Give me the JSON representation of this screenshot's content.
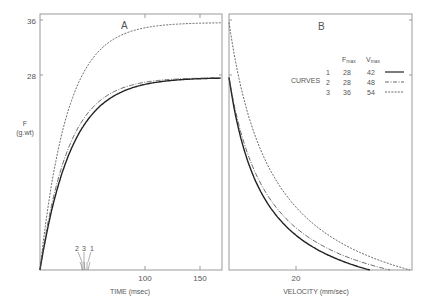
{
  "chart_data": [
    {
      "panel": "A",
      "type": "line",
      "title": "A",
      "xlabel": "TIME (msec)",
      "ylabel": "F",
      "ylabel_unit": "(g.wt)",
      "x_ticks": [
        100,
        150
      ],
      "y_ticks": [
        28,
        36
      ],
      "xlim": [
        0,
        165
      ],
      "ylim": [
        0,
        37
      ],
      "markers": {
        "labels": [
          "2",
          "3",
          "1"
        ],
        "description": "half-rise time markers for curves 2, 3, 1"
      },
      "series": [
        {
          "name": "1",
          "style": "solid",
          "Fmax": 28,
          "Vmax": 42,
          "x": [
            0,
            20,
            40,
            60,
            80,
            100,
            120,
            140,
            165
          ],
          "y": [
            0,
            12.5,
            19.5,
            23.5,
            25.7,
            26.9,
            27.5,
            27.8,
            28
          ]
        },
        {
          "name": "2",
          "style": "dash-dot",
          "Fmax": 28,
          "Vmax": 48,
          "x": [
            0,
            20,
            40,
            60,
            80,
            100,
            120,
            140,
            165
          ],
          "y": [
            0,
            13.6,
            20.6,
            24.3,
            26.2,
            27.2,
            27.6,
            27.9,
            28
          ]
        },
        {
          "name": "3",
          "style": "dashed",
          "Fmax": 36,
          "Vmax": 54,
          "x": [
            0,
            20,
            40,
            60,
            80,
            100,
            120,
            140,
            165
          ],
          "y": [
            0,
            19,
            27,
            31,
            33.3,
            34.5,
            35.2,
            35.6,
            35.9
          ]
        }
      ]
    },
    {
      "panel": "B",
      "type": "line",
      "title": "B",
      "xlabel": "VELOCITY (mm/sec)",
      "ylabel": "F",
      "x_ticks": [
        20
      ],
      "xlim": [
        0,
        54
      ],
      "ylim": [
        0,
        37
      ],
      "series": [
        {
          "name": "1",
          "style": "solid",
          "Fmax": 28,
          "Vmax": 42,
          "x": [
            0,
            5,
            10,
            20,
            30,
            42
          ],
          "y": [
            28,
            17.8,
            11.9,
            5.4,
            2.1,
            0
          ]
        },
        {
          "name": "2",
          "style": "dash-dot",
          "Fmax": 28,
          "Vmax": 48,
          "x": [
            0,
            5,
            10,
            20,
            30,
            40,
            48
          ],
          "y": [
            28,
            18.5,
            12.9,
            6.3,
            3.0,
            0.9,
            0
          ]
        },
        {
          "name": "3",
          "style": "dashed",
          "Fmax": 36,
          "Vmax": 54,
          "x": [
            0,
            5,
            10,
            20,
            30,
            40,
            54
          ],
          "y": [
            36,
            24.5,
            17.5,
            9.3,
            4.8,
            2.0,
            0
          ]
        }
      ]
    }
  ],
  "panels": {
    "a": {
      "label": "A",
      "y_tick_36": "36",
      "y_tick_28": "28",
      "y_label": "F",
      "y_unit": "(g.wt)",
      "x_tick_100": "100",
      "x_tick_150": "150",
      "x_label": "TIME (msec)",
      "marker_2": "2",
      "marker_3": "3",
      "marker_1": "1"
    },
    "b": {
      "label": "B",
      "x_tick_20": "20",
      "x_label": "VELOCITY (mm/sec)"
    }
  },
  "legend": {
    "title": "CURVES",
    "col_fmax": "F",
    "col_fmax_sub": "max",
    "col_vmax": "V",
    "col_vmax_sub": "max",
    "rows": [
      {
        "id": "1",
        "fmax": "28",
        "vmax": "42",
        "style": "solid"
      },
      {
        "id": "2",
        "fmax": "28",
        "vmax": "48",
        "style": "dash-dot"
      },
      {
        "id": "3",
        "fmax": "36",
        "vmax": "54",
        "style": "dashed"
      }
    ]
  },
  "colors": {
    "axis": "#9a9a9a",
    "curve": "#333333",
    "text": "#555555"
  }
}
